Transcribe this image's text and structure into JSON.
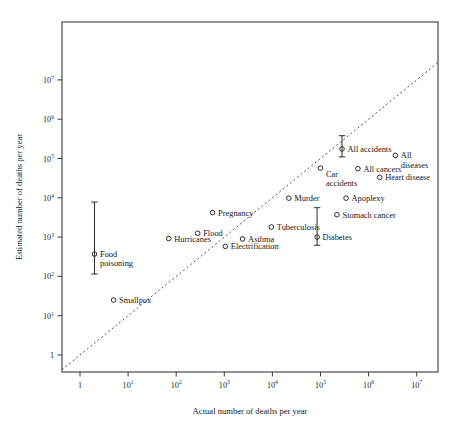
{
  "chart_data": {
    "type": "scatter",
    "title": "",
    "xlabel": "Actual number of deaths per year",
    "ylabel": "Estimated number of deaths per year",
    "xscale": "log",
    "yscale": "log",
    "xlim": [
      0.55,
      30000000.0
    ],
    "ylim": [
      0.55,
      30000000.0
    ],
    "grid": false,
    "legend": "none",
    "xtick_labels": [
      "1",
      "10¹",
      "10²",
      "10³",
      "10⁴",
      "10⁵",
      "10⁶",
      "10⁷"
    ],
    "xtick_values": [
      1,
      10,
      100,
      1000,
      10000,
      100000,
      1000000,
      10000000
    ],
    "ytick_labels": [
      "1",
      "10¹",
      "10²",
      "10³",
      "10⁴",
      "10⁵",
      "10⁶",
      "10⁷"
    ],
    "ytick_values": [
      1,
      10,
      100,
      1000,
      10000,
      100000,
      1000000,
      10000000
    ],
    "annotations": [
      {
        "text": "identity line (estimated = actual)",
        "style": "dotted diagonal"
      }
    ],
    "points": [
      {
        "label": "Food poisoning",
        "x": 2,
        "y": 370,
        "ylow": 115,
        "yhigh": 7800,
        "label_pos": "right",
        "label_lines": [
          "Food",
          "poisoning"
        ]
      },
      {
        "label": "Smallpox",
        "x": 5,
        "y": 25,
        "label_pos": "right",
        "label_lines": [
          "Smallpox"
        ]
      },
      {
        "label": "Hurricanes",
        "x": 70,
        "y": 920,
        "label_pos": "right",
        "label_lines": [
          "Hurricanes"
        ]
      },
      {
        "label": "Flood",
        "x": 280,
        "y": 1250,
        "label_pos": "right",
        "label_lines": [
          "Flood"
        ]
      },
      {
        "label": "Pregnancy",
        "x": 570,
        "y": 4200,
        "label_pos": "right",
        "label_lines": [
          "Pregnancy"
        ]
      },
      {
        "label": "Electrification",
        "x": 1050,
        "y": 580,
        "label_pos": "right",
        "label_lines": [
          "Electrification"
        ]
      },
      {
        "label": "Asthma",
        "x": 2400,
        "y": 900,
        "label_pos": "right",
        "label_lines": [
          "Asthma"
        ]
      },
      {
        "label": "Tuberculosis",
        "x": 9500,
        "y": 1800,
        "label_pos": "right",
        "label_lines": [
          "Tuberculosis"
        ]
      },
      {
        "label": "Murder",
        "x": 22000,
        "y": 9800,
        "label_pos": "right",
        "label_lines": [
          "Murder"
        ]
      },
      {
        "label": "Diabetes",
        "x": 85000,
        "y": 1000,
        "ylow": 620,
        "yhigh": 5600,
        "label_pos": "right",
        "label_lines": [
          "Diabetes"
        ]
      },
      {
        "label": "Car accidents",
        "x": 100000,
        "y": 57000,
        "label_pos": "below-right",
        "label_lines": [
          "Car",
          "accidents"
        ]
      },
      {
        "label": "All accidents",
        "x": 280000,
        "y": 175000,
        "ylow": 110000,
        "yhigh": 380000,
        "label_pos": "right",
        "label_lines": [
          "All accidents"
        ]
      },
      {
        "label": "Stomach cancer",
        "x": 220000,
        "y": 3700,
        "label_pos": "right",
        "label_lines": [
          "Stomach cancer"
        ]
      },
      {
        "label": "Apoplexy",
        "x": 340000,
        "y": 9800,
        "label_pos": "right",
        "label_lines": [
          "Apoplexy"
        ]
      },
      {
        "label": "All cancers",
        "x": 600000,
        "y": 55000,
        "label_pos": "right",
        "label_lines": [
          "All cancers"
        ]
      },
      {
        "label": "Heart disease",
        "x": 1700000,
        "y": 33000,
        "label_pos": "right",
        "label_lines": [
          "Heart disease"
        ]
      },
      {
        "label": "All diseases",
        "x": 3600000,
        "y": 120000,
        "label_pos": "right",
        "label_lines": [
          "All",
          "diseases"
        ]
      }
    ]
  },
  "colors": {
    "axis": "#3a3a3a",
    "marker": "#2b2b2b",
    "text": "#1a1a1a",
    "diagonal": "#3f3f3f",
    "background": "#ffffff"
  }
}
